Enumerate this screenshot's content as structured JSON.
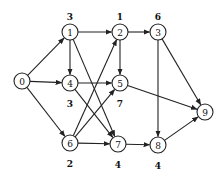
{
  "diagram": {
    "type": "directed-network",
    "nodes": [
      {
        "id": "0",
        "label": "0",
        "x": 22,
        "y": 81,
        "weight": null
      },
      {
        "id": "1",
        "label": "1",
        "x": 70,
        "y": 32,
        "weight": "3",
        "weight_pos": "above"
      },
      {
        "id": "2",
        "label": "2",
        "x": 120,
        "y": 32,
        "weight": "1",
        "weight_pos": "above"
      },
      {
        "id": "3",
        "label": "3",
        "x": 158,
        "y": 32,
        "weight": "6",
        "weight_pos": "above"
      },
      {
        "id": "4",
        "label": "4",
        "x": 70,
        "y": 83,
        "weight": "3",
        "weight_pos": "below"
      },
      {
        "id": "5",
        "label": "5",
        "x": 120,
        "y": 83,
        "weight": "7",
        "weight_pos": "below"
      },
      {
        "id": "6",
        "label": "6",
        "x": 70,
        "y": 143,
        "weight": "2",
        "weight_pos": "below"
      },
      {
        "id": "7",
        "label": "7",
        "x": 118,
        "y": 144,
        "weight": "4",
        "weight_pos": "below"
      },
      {
        "id": "8",
        "label": "8",
        "x": 158,
        "y": 145,
        "weight": "4",
        "weight_pos": "below"
      },
      {
        "id": "9",
        "label": "9",
        "x": 205,
        "y": 112,
        "weight": null
      }
    ],
    "edges": [
      [
        "0",
        "1"
      ],
      [
        "0",
        "4"
      ],
      [
        "0",
        "6"
      ],
      [
        "1",
        "2"
      ],
      [
        "1",
        "4"
      ],
      [
        "1",
        "7"
      ],
      [
        "2",
        "3"
      ],
      [
        "2",
        "5"
      ],
      [
        "3",
        "9"
      ],
      [
        "3",
        "8"
      ],
      [
        "4",
        "5"
      ],
      [
        "4",
        "7"
      ],
      [
        "5",
        "9"
      ],
      [
        "6",
        "2"
      ],
      [
        "6",
        "5"
      ],
      [
        "6",
        "7"
      ],
      [
        "7",
        "8"
      ],
      [
        "8",
        "9"
      ]
    ],
    "node_radius": 8,
    "stroke_color": "#222222"
  }
}
